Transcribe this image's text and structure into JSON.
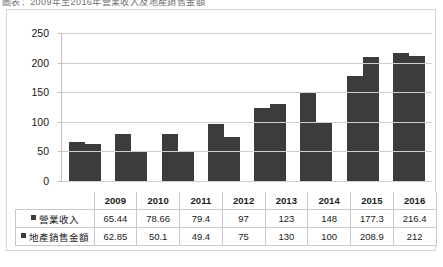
{
  "caption": {
    "text": "圖表：2009年至2016年營業收入及地產銷售金額"
  },
  "chart_data": {
    "type": "bar",
    "title": "",
    "xlabel": "",
    "ylabel": "",
    "categories": [
      "2009",
      "2010",
      "2011",
      "2012",
      "2013",
      "2014",
      "2015",
      "2016"
    ],
    "series": [
      {
        "name": "營業收入",
        "values": [
          65.44,
          78.66,
          79.4,
          97,
          123,
          148,
          177.3,
          216.4
        ],
        "labels": [
          "65.44",
          "78.66",
          "79.4",
          "97",
          "123",
          "148",
          "177.3",
          "216.4"
        ],
        "color": "#3c3c3c"
      },
      {
        "name": "地產銷售金額",
        "values": [
          62.85,
          50.1,
          49.4,
          75,
          130,
          100,
          208.9,
          212
        ],
        "labels": [
          "62.85",
          "50.1",
          "49.4",
          "75",
          "130",
          "100",
          "208.9",
          "212"
        ],
        "color": "#3c3c3c"
      }
    ],
    "ylim": [
      0,
      250
    ],
    "yticks": [
      0,
      50,
      100,
      150,
      200,
      250
    ],
    "ytick_labels": [
      "0",
      "50",
      "100",
      "150",
      "200",
      "250"
    ],
    "grid": true,
    "legend_position": "data-table",
    "data_table_visible": true
  }
}
